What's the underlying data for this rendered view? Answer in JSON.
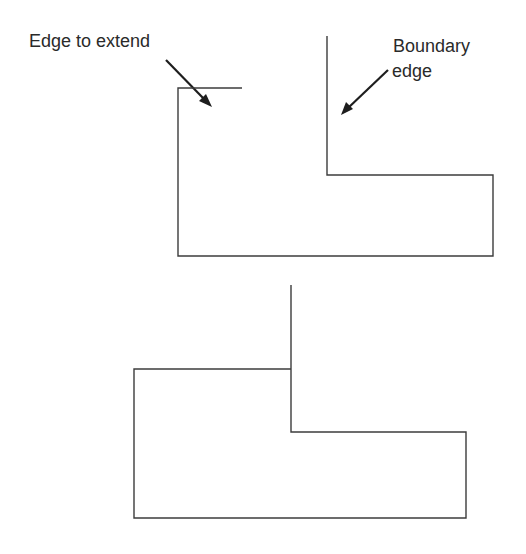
{
  "diagram": {
    "labels": {
      "edge_to_extend": "Edge to extend",
      "boundary_line1": "Boundary",
      "boundary_line2": "edge"
    },
    "colors": {
      "line": "#3c3c3c",
      "arrow": "#1e1e1e",
      "text": "#2a2a2a",
      "background": "#ffffff"
    },
    "figures": [
      {
        "name": "before",
        "description": "Short top edge not reaching vertical boundary edge"
      },
      {
        "name": "after",
        "description": "Top edge extended to meet boundary edge"
      }
    ]
  }
}
